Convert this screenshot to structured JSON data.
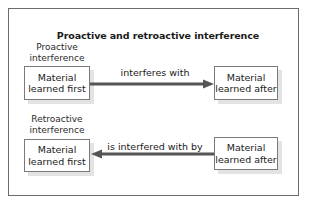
{
  "diagram": {
    "title": "Proactive and retroactive interference",
    "colors": {
      "frame_border": "#6b6b6b",
      "box_border": "#7a7a7a",
      "box_shadow": "#e3e3e3",
      "arrow": "#555555",
      "text": "#1a1a1a"
    },
    "sections": [
      {
        "label_line1": "Proactive",
        "label_line2": "interference",
        "left_box": {
          "line1": "Material",
          "line2": "learned first"
        },
        "right_box": {
          "line1": "Material",
          "line2": "learned after"
        },
        "arrow_label": "interferes with",
        "arrow_direction": "right"
      },
      {
        "label_line1": "Retroactive",
        "label_line2": "interference",
        "left_box": {
          "line1": "Material",
          "line2": "learned first"
        },
        "right_box": {
          "line1": "Material",
          "line2": "learned after"
        },
        "arrow_label": "is interfered with by",
        "arrow_direction": "left"
      }
    ]
  }
}
